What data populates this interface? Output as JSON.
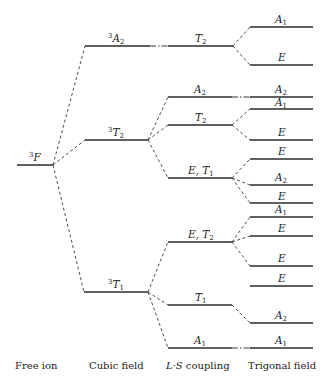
{
  "column_labels": {
    "free_ion": "Free ion",
    "cubic_field": "Cubic field",
    "ls_coupling_italic": "L·S",
    "ls_coupling_rest": " coupling",
    "trigonal_field": "Trigonal field"
  },
  "free_ion": {
    "term": "F",
    "multiplicity": "3"
  },
  "cubic_field": {
    "levels": [
      {
        "term": "A",
        "sub": "2",
        "multiplicity": "3"
      },
      {
        "term": "T",
        "sub": "2",
        "multiplicity": "3"
      },
      {
        "term": "T",
        "sub": "1",
        "multiplicity": "3"
      }
    ]
  },
  "ls_coupling": {
    "levels": [
      {
        "term": "T",
        "sub": "2",
        "parent": "3A2"
      },
      {
        "term": "A",
        "sub": "2",
        "parent": "3T2"
      },
      {
        "term": "T",
        "sub": "2",
        "parent": "3T2"
      },
      {
        "term": "E, T",
        "sub": "1",
        "parent": "3T2"
      },
      {
        "term": "E, T",
        "sub": "2",
        "parent": "3T1"
      },
      {
        "term": "T",
        "sub": "1",
        "parent": "3T1"
      },
      {
        "term": "A",
        "sub": "1",
        "parent": "3T1"
      }
    ]
  },
  "trigonal_field": {
    "levels": [
      {
        "term": "A",
        "sub": "1"
      },
      {
        "term": "E",
        "sub": ""
      },
      {
        "term": "A",
        "sub": "2"
      },
      {
        "term": "A",
        "sub": "1"
      },
      {
        "term": "E",
        "sub": ""
      },
      {
        "term": "E",
        "sub": ""
      },
      {
        "term": "A",
        "sub": "2"
      },
      {
        "term": "E",
        "sub": ""
      },
      {
        "term": "A",
        "sub": "1"
      },
      {
        "term": "E",
        "sub": ""
      },
      {
        "term": "E",
        "sub": ""
      },
      {
        "term": "E",
        "sub": ""
      },
      {
        "term": "A",
        "sub": "2"
      },
      {
        "term": "A",
        "sub": "1"
      }
    ]
  }
}
